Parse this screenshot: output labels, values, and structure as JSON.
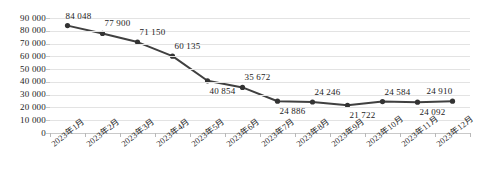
{
  "chart_data": {
    "type": "line",
    "title": "",
    "subtitle": "",
    "xlabel": "",
    "ylabel": "",
    "grid": true,
    "legend": false,
    "legend_position": "none",
    "ylim": [
      0,
      90000
    ],
    "ytick_labels": [
      "90 000",
      "80 000",
      "70 000",
      "60 000",
      "50 000",
      "40 000",
      "30 000",
      "20 000",
      "10 000",
      "0"
    ],
    "ytick_values": [
      90000,
      80000,
      70000,
      60000,
      50000,
      40000,
      30000,
      20000,
      10000,
      0
    ],
    "categories": [
      "2023年1月",
      "2023年2月",
      "2023年3月",
      "2023年4月",
      "2023年5月",
      "2023年6月",
      "2023年7月",
      "2023年8月",
      "2023年9月",
      "2023年10月",
      "2023年11月",
      "2023年12月"
    ],
    "values": [
      84048,
      77900,
      71150,
      60135,
      40854,
      35672,
      24886,
      24246,
      21722,
      24584,
      24092,
      24910
    ],
    "data_labels": [
      "84 048",
      "77 900",
      "71 150",
      "60 135",
      "40 854",
      "35 672",
      "24 886",
      "24 246",
      "21 722",
      "24 584",
      "24 092",
      "24 910"
    ],
    "data_label_positions": [
      "above",
      "above",
      "above",
      "above",
      "below",
      "above",
      "below",
      "above",
      "below",
      "above",
      "below",
      "above"
    ],
    "series": [
      {
        "name": "",
        "color": "#404040",
        "marker": "circle",
        "values": [
          84048,
          77900,
          71150,
          60135,
          40854,
          35672,
          24886,
          24246,
          21722,
          24584,
          24092,
          24910
        ]
      }
    ],
    "colors": {
      "line": "#404040",
      "marker": "#333333",
      "gridline": "#e3e3e3",
      "axis": "#c9c9c9",
      "text": "#1c1c1c",
      "background": "#ffffff"
    }
  }
}
